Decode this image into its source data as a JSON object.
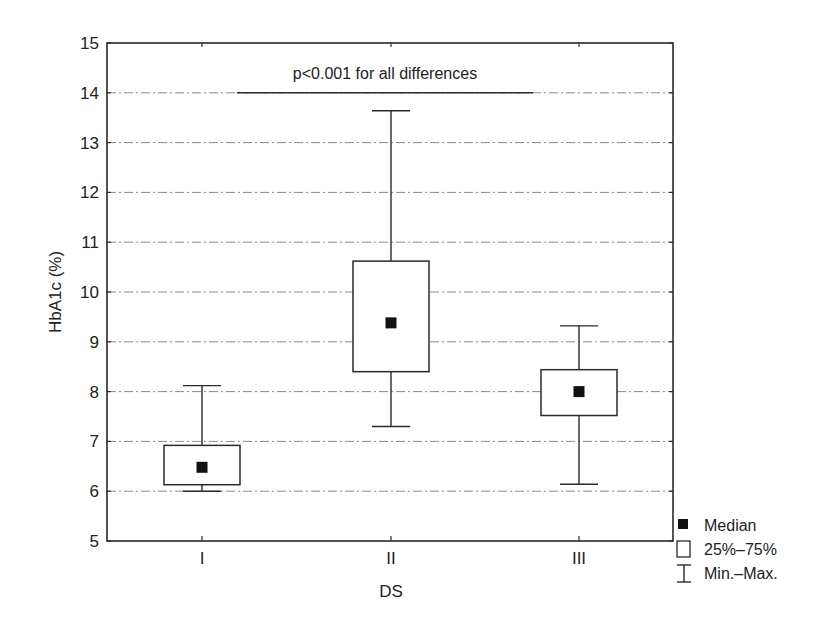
{
  "chart_data": {
    "type": "boxplot",
    "title": "",
    "xlabel": "DS",
    "ylabel": "HbA1c (%)",
    "ylim": [
      5,
      15
    ],
    "yticks": [
      5,
      6,
      7,
      8,
      9,
      10,
      11,
      12,
      13,
      14,
      15
    ],
    "grid": true,
    "grid_style": "dash-dot horizontal",
    "categories": [
      "I",
      "II",
      "III"
    ],
    "series": [
      {
        "category": "I",
        "min": 6.0,
        "q1": 6.13,
        "median": 6.48,
        "q3": 6.92,
        "max": 8.12
      },
      {
        "category": "II",
        "min": 7.3,
        "q1": 8.4,
        "median": 9.38,
        "q3": 10.62,
        "max": 13.64
      },
      {
        "category": "III",
        "min": 6.14,
        "q1": 7.52,
        "median": 8.0,
        "q3": 8.44,
        "max": 9.32
      }
    ],
    "annotations": [
      {
        "text": "p<0.001 for all differences",
        "y": 14.0,
        "x_from": "I",
        "x_to": "III",
        "type": "significance-bar"
      }
    ],
    "legend": {
      "position": "bottom-right outside",
      "entries": [
        {
          "symbol": "filled-square",
          "label": "Median"
        },
        {
          "symbol": "open-box",
          "label": "25%–75%"
        },
        {
          "symbol": "whisker",
          "label": "Min.–Max."
        }
      ]
    }
  },
  "layout": {
    "plot": {
      "left": 107,
      "top": 43,
      "right": 673,
      "bottom": 541
    },
    "x_positions": [
      202,
      391,
      579
    ],
    "box_half_width": 38,
    "cap_half_width": 19,
    "median_size": 11,
    "sig_line": {
      "x1": 237,
      "x2": 533
    }
  }
}
